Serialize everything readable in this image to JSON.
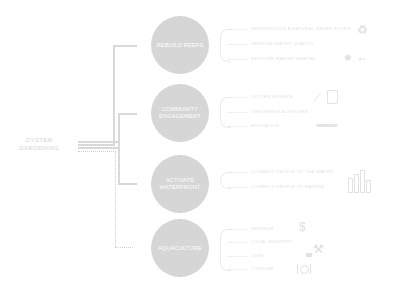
{
  "root": {
    "line1": "OYSTER",
    "line2": "GARDENING"
  },
  "branches": [
    {
      "label_lines": [
        "REBUILD REEFS"
      ],
      "items": [
        {
          "text": "REINTRODUCE A NATURAL WATER FILTER",
          "icon": "recycle-icon"
        },
        {
          "text": "IMPROVE WATER QUALITY"
        },
        {
          "text": "RESTORE MARINE HABITAT",
          "icon": "crab-fish-icon"
        }
      ],
      "connector": "solid"
    },
    {
      "label_lines": [
        "COMMUNITY",
        "ENGAGEMENT"
      ],
      "items": [
        {
          "text": "CITIZEN SCIENCE",
          "icon": "microscope-clipboard-icon"
        },
        {
          "text": "CHILDREN'S ACTIVITIES"
        },
        {
          "text": "EDUCATION",
          "icon": "boat-icon"
        }
      ],
      "connector": "solid"
    },
    {
      "label_lines": [
        "ACTIVATE",
        "WATERFRONT"
      ],
      "items": [
        {
          "text": "CONNECT PEOPLE TO THE WATER",
          "icon": "city-skyline-icon"
        },
        {
          "text": "CONNECT PEOPLE TO NATURE"
        }
      ],
      "connector": "solid"
    },
    {
      "label_lines": [
        "AQUACULTURE"
      ],
      "items": [
        {
          "text": "REVENUE",
          "icon": "dollar-icon"
        },
        {
          "text": "LOCAL INDUSTRY",
          "icon": "worker-icon"
        },
        {
          "text": "JOBS"
        },
        {
          "text": "TOURISM",
          "icon": "dining-icon"
        }
      ],
      "connector": "dotted"
    }
  ],
  "colors": {
    "circle": "#d6d6d6",
    "line": "#d9d9d9",
    "text_faint": "#e2e2e2"
  }
}
